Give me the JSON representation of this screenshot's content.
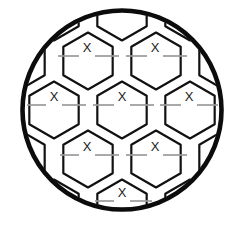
{
  "figure": {
    "name": "soccer-ball-fill-in-the-blank",
    "type": "diagram",
    "background_color": "#ffffff",
    "outline_color": "#0c0c0c",
    "outline_width": 4.6,
    "panel_stroke_color": "#111111",
    "panel_stroke_width": 2.2,
    "blank_line_color": "#9a9a9a",
    "blank_line_width": 1.7,
    "mark_color": "#1a1a1a",
    "mark_glyph": "X",
    "mark_count": 7
  },
  "circle": {
    "cx": 122,
    "cy": 110,
    "r": 99.5
  },
  "hex_geometry": {
    "radius": 28.5,
    "orientation": "pointy-top",
    "columns": 5,
    "rows": 5,
    "origin_x": 122,
    "origin_y": 110
  },
  "marks": [
    {
      "id": "mark-1",
      "label": "X",
      "x": 87,
      "y": 49,
      "line_left_x1": 58,
      "line_left_x2": 79,
      "line_right_x1": 95,
      "line_right_x2": 119,
      "line_y": 56
    },
    {
      "id": "mark-2",
      "label": "X",
      "x": 155,
      "y": 49,
      "line_left_x1": 126,
      "line_left_x2": 147,
      "line_right_x1": 163,
      "line_right_x2": 187,
      "line_y": 56
    },
    {
      "id": "mark-3",
      "label": "X",
      "x": 54,
      "y": 98,
      "line_left_x1": 27,
      "line_left_x2": 46,
      "line_right_x1": 62,
      "line_right_x2": 86,
      "line_y": 105
    },
    {
      "id": "mark-4",
      "label": "X",
      "x": 122,
      "y": 98,
      "line_left_x1": 93,
      "line_left_x2": 114,
      "line_right_x1": 130,
      "line_right_x2": 154,
      "line_y": 105
    },
    {
      "id": "mark-5",
      "label": "X",
      "x": 189,
      "y": 98,
      "line_left_x1": 160,
      "line_left_x2": 181,
      "line_right_x1": 197,
      "line_right_x2": 218,
      "line_y": 105
    },
    {
      "id": "mark-6",
      "label": "X",
      "x": 87,
      "y": 148,
      "line_left_x1": 60,
      "line_left_x2": 79,
      "line_right_x1": 95,
      "line_right_x2": 119,
      "line_y": 155
    },
    {
      "id": "mark-7",
      "label": "X",
      "x": 155,
      "y": 148,
      "line_left_x1": 126,
      "line_left_x2": 147,
      "line_right_x1": 163,
      "line_right_x2": 187,
      "line_y": 155
    },
    {
      "id": "mark-8",
      "label": "X",
      "x": 122,
      "y": 194,
      "line_left_x1": 95,
      "line_left_x2": 114,
      "line_right_x1": 130,
      "line_right_x2": 152,
      "line_y": 201
    }
  ],
  "hex_centers": [
    {
      "id": "hex-r0-c0",
      "cx": 88,
      "cy": 61
    },
    {
      "id": "hex-r0-c1",
      "cx": 156,
      "cy": 61
    },
    {
      "id": "hex-r0-c2",
      "cx": 20,
      "cy": 61
    },
    {
      "id": "hex-r0-c3",
      "cx": 224,
      "cy": 61
    },
    {
      "id": "hex-t-c0",
      "cx": 122,
      "cy": 12
    },
    {
      "id": "hex-t-c1",
      "cx": 54,
      "cy": 12
    },
    {
      "id": "hex-t-c2",
      "cx": 190,
      "cy": 12
    },
    {
      "id": "hex-r1-c0",
      "cx": 54,
      "cy": 110
    },
    {
      "id": "hex-r1-c1",
      "cx": 122,
      "cy": 110
    },
    {
      "id": "hex-r1-c2",
      "cx": 190,
      "cy": 110
    },
    {
      "id": "hex-r1-c3",
      "cx": 258,
      "cy": 110
    },
    {
      "id": "hex-r1-c4",
      "cx": -14,
      "cy": 110
    },
    {
      "id": "hex-r2-c0",
      "cx": 88,
      "cy": 159
    },
    {
      "id": "hex-r2-c1",
      "cx": 156,
      "cy": 159
    },
    {
      "id": "hex-r2-c2",
      "cx": 20,
      "cy": 159
    },
    {
      "id": "hex-r2-c3",
      "cx": 224,
      "cy": 159
    },
    {
      "id": "hex-r3-c0",
      "cx": 122,
      "cy": 208
    },
    {
      "id": "hex-r3-c1",
      "cx": 54,
      "cy": 208
    },
    {
      "id": "hex-r3-c2",
      "cx": 190,
      "cy": 208
    }
  ]
}
